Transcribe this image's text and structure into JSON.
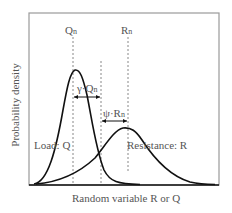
{
  "diagram": {
    "y_axis_label": "Probability density",
    "x_axis_label": "Random variable R or Q",
    "labels": {
      "qn_main": "Q",
      "qn_sub": "n",
      "rn_main": "R",
      "rn_sub": "n",
      "gamma_main": "γ·Q",
      "gamma_sub": "n",
      "psi_main": "ψ·R",
      "psi_sub": "n",
      "load": "Load: Q",
      "resistance": "Resistance: R"
    },
    "colors": {
      "frame": "#999999",
      "curve": "#111111",
      "dashed": "#888888",
      "text": "#555555"
    }
  }
}
